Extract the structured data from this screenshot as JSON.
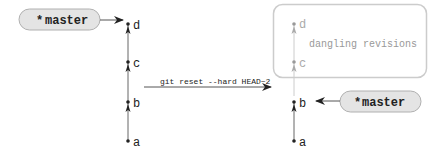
{
  "left_graph": {
    "branch_label": "master",
    "branch_marker": "*",
    "commits": [
      "a",
      "b",
      "c",
      "d"
    ],
    "head_points_to": "d"
  },
  "command": {
    "text": "git reset --hard HEAD~2"
  },
  "right_graph": {
    "branch_label": "master",
    "branch_marker": "*",
    "commits": [
      "a",
      "b"
    ],
    "head_points_to": "b",
    "dangling": {
      "label": "dangling revisions",
      "commits": [
        "c",
        "d"
      ]
    }
  },
  "colors": {
    "pill_fill": "#e4e4e4",
    "pill_stroke": "#b0b0b0",
    "line": "#555555",
    "faded": "#bbbbbb",
    "box_stroke": "#cccccc"
  }
}
